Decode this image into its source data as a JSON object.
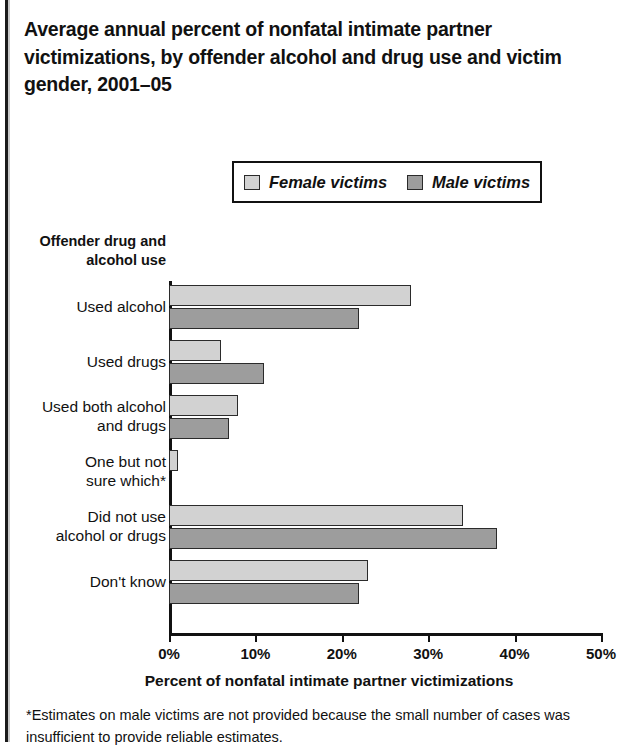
{
  "title": "Average annual percent of nonfatal intimate partner victimizations, by offender alcohol and drug use and victim gender, 2001–05",
  "legend": {
    "items": [
      {
        "label": "Female victims",
        "color": "#d2d2d2",
        "icon": "legend-swatch-icon"
      },
      {
        "label": "Male victims",
        "color": "#9d9d9d",
        "icon": "legend-swatch-icon"
      }
    ]
  },
  "y_axis_header": "Offender drug and alcohol use",
  "x_axis_title": "Percent of nonfatal intimate partner victimizations",
  "tick_labels": [
    "0%",
    "10%",
    "20%",
    "30%",
    "40%",
    "50%"
  ],
  "footnote": "*Estimates on male victims are not provided because the small number of cases was insufficient to provide reliable estimates.",
  "chart_data": {
    "type": "bar",
    "orientation": "horizontal",
    "title": "Average annual percent of nonfatal intimate partner victimizations, by offender alcohol and drug use and victim gender, 2001–05",
    "xlabel": "Percent of nonfatal intimate partner victimizations",
    "ylabel": "Offender drug and alcohol use",
    "xlim": [
      0,
      50
    ],
    "xticks": [
      0,
      10,
      20,
      30,
      40,
      50
    ],
    "xtick_labels": [
      "0%",
      "10%",
      "20%",
      "30%",
      "40%",
      "50%"
    ],
    "grid": false,
    "legend_position": "top-center",
    "categories": [
      "Used alcohol",
      "Used drugs",
      "Used both alcohol and drugs",
      "One but not sure which*",
      "Did not use alcohol or drugs",
      "Don't know"
    ],
    "category_lines": [
      [
        "Used alcohol"
      ],
      [
        "Used drugs"
      ],
      [
        "Used both alcohol",
        "and drugs"
      ],
      [
        "One but not",
        "sure which*"
      ],
      [
        "Did not use",
        "alcohol or drugs"
      ],
      [
        "Don't know"
      ]
    ],
    "series": [
      {
        "name": "Female victims",
        "color": "#d2d2d2",
        "values": [
          28,
          6,
          8,
          1,
          34,
          23
        ]
      },
      {
        "name": "Male victims",
        "color": "#9d9d9d",
        "values": [
          22,
          11,
          7,
          null,
          38,
          22
        ]
      }
    ]
  }
}
